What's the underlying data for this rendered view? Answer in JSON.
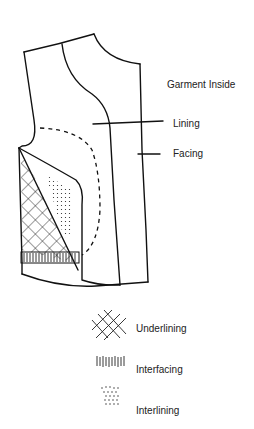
{
  "diagram": {
    "title": "Garment Inside",
    "callouts": [
      {
        "label": "Lining"
      },
      {
        "label": "Facing"
      }
    ],
    "legend": [
      {
        "label": "Underlining",
        "pattern": "crosshatch-icon"
      },
      {
        "label": "Interfacing",
        "pattern": "vertical-lines-icon"
      },
      {
        "label": "Interlining",
        "pattern": "dots-icon"
      }
    ],
    "colors": {
      "ink": "#111111",
      "background": "#ffffff"
    }
  }
}
